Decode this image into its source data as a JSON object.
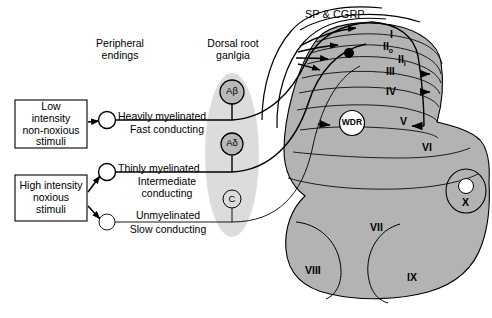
{
  "figure": {
    "colors": {
      "grey_matter": "#b3b3b3",
      "ganglia_band": "#dcdcdc",
      "outline": "#000000",
      "background": "#ffffff",
      "text": "#000000"
    }
  },
  "headers": {
    "peripheral_endings": "Peripheral\nendings",
    "dorsal_root_ganglia": "Dorsal root\nganlgia"
  },
  "stimulus_boxes": [
    {
      "id": "low",
      "text": "Low\nintensity\nnon-noxious\nstimuli"
    },
    {
      "id": "high",
      "text": "High intensity\nnoxious\nstimuli"
    }
  ],
  "fibers": [
    {
      "id": "a-beta",
      "ending_shape": "open-circle",
      "myelination": "Heavily myelinated",
      "conduction": "Fast conducting",
      "ganglion_label": "Aβ",
      "source_box": "low"
    },
    {
      "id": "a-delta",
      "ending_shape": "open-circle",
      "myelination": "Thinly myelinated",
      "conduction": "Intermediate\nconducting",
      "ganglion_label": "Aδ",
      "source_box": "high"
    },
    {
      "id": "c",
      "ending_shape": "open-circle",
      "myelination": "Unmyelinated",
      "conduction": "Slow conducting",
      "ganglion_label": "C",
      "source_box": "high"
    }
  ],
  "neurotransmitters": {
    "label": "SP & CGRP"
  },
  "neurons": [
    {
      "id": "wdr",
      "label": "WDR",
      "full_name": "wide dynamic range neuron"
    }
  ],
  "laminae": [
    {
      "id": "I",
      "label": "I"
    },
    {
      "id": "IIo",
      "label": "II",
      "subscript": "o"
    },
    {
      "id": "IIi",
      "label": "II",
      "subscript": "i"
    },
    {
      "id": "III",
      "label": "III"
    },
    {
      "id": "IV",
      "label": "IV"
    },
    {
      "id": "V",
      "label": "V"
    },
    {
      "id": "VI",
      "label": "VI"
    },
    {
      "id": "VII",
      "label": "VII"
    },
    {
      "id": "VIII",
      "label": "VIII"
    },
    {
      "id": "IX",
      "label": "IX"
    },
    {
      "id": "X",
      "label": "X"
    }
  ]
}
